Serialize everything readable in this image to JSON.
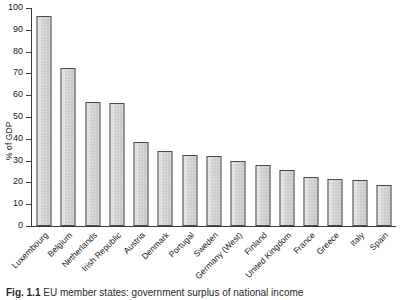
{
  "chart_data": {
    "type": "bar",
    "title": "",
    "xlabel": "",
    "ylabel": "% of GDP",
    "ylim": [
      0,
      100
    ],
    "ytick_values": [
      0,
      10,
      20,
      30,
      40,
      50,
      60,
      70,
      80,
      90,
      100
    ],
    "ytick_labels": [
      "0",
      "10",
      "20",
      "30",
      "40",
      "50",
      "60",
      "70",
      "80",
      "90",
      "100"
    ],
    "grid": false,
    "legend": "none",
    "categories": [
      "Luxembourg",
      "Belgium",
      "Netherlands",
      "Irish Republic",
      "Austria",
      "Denmark",
      "Portugal",
      "Sweden",
      "Germany (West)",
      "Finland",
      "United Kingdom",
      "France",
      "Greece",
      "Italy",
      "Spain"
    ],
    "values": [
      96.5,
      72.3,
      56.9,
      56.4,
      38.4,
      34.2,
      32.8,
      32.3,
      29.8,
      27.8,
      25.9,
      22.4,
      21.4,
      21.3,
      18.8
    ]
  },
  "caption": {
    "label": "Fig. 1.1",
    "text": "EU member states: government surplus of national income"
  }
}
